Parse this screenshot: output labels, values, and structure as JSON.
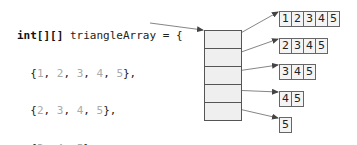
{
  "code": {
    "declaration_keyword": "int[][]",
    "declaration_rest": " triangleArray = {",
    "rows": [
      {
        "open": "  {",
        "values": [
          "1",
          "2",
          "3",
          "4",
          "5"
        ],
        "close": "},"
      },
      {
        "open": "  {",
        "values": [
          "2",
          "3",
          "4",
          "5"
        ],
        "close": "},"
      },
      {
        "open": "  {",
        "values": [
          "3",
          "4",
          "5"
        ],
        "close": "},"
      },
      {
        "open": "  {",
        "values": [
          "4",
          "5"
        ],
        "close": "},"
      },
      {
        "open": "  {",
        "values": [
          "5"
        ],
        "close": "}"
      }
    ],
    "closing": "};"
  },
  "diagram": {
    "outer_array_cells": 5,
    "row_arrays": [
      {
        "values": [
          "1",
          "2",
          "3",
          "4",
          "5"
        ]
      },
      {
        "values": [
          "2",
          "3",
          "4",
          "5"
        ]
      },
      {
        "values": [
          "3",
          "4",
          "5"
        ]
      },
      {
        "values": [
          "4",
          "5"
        ]
      },
      {
        "values": [
          "5"
        ]
      }
    ]
  },
  "colors": {
    "code_text": "#222222",
    "code_numbers": "#aaaaaa",
    "outer_fill": "#efefef",
    "border": "#555555",
    "arrow": "#555555"
  }
}
